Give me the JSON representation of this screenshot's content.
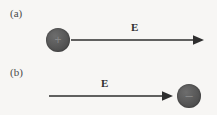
{
  "figure": {
    "background_color": "#f7f6f4",
    "width": 217,
    "height": 115
  },
  "panels": [
    {
      "id": "a",
      "label": "(a)",
      "charge": {
        "sign": "+",
        "polarity": "positive",
        "color": "#565656",
        "position": "left-of-arrow",
        "center_x": 58,
        "center_y": 40,
        "diameter": 24
      },
      "field": {
        "label": "E",
        "direction": "right",
        "color": "#2e2e2e",
        "start_x": 72,
        "end_x": 204,
        "y": 40
      }
    },
    {
      "id": "b",
      "label": "(b)",
      "charge": {
        "sign": "–",
        "polarity": "negative",
        "color": "#565656",
        "position": "right-of-arrow",
        "center_x": 189,
        "center_y": 96,
        "diameter": 24
      },
      "field": {
        "label": "E",
        "direction": "right",
        "color": "#2e2e2e",
        "start_x": 50,
        "end_x": 173,
        "y": 96
      }
    }
  ]
}
